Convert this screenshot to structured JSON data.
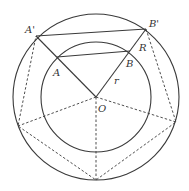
{
  "diagram": {
    "type": "geometry",
    "center": {
      "label": "O",
      "x": 96,
      "y": 97
    },
    "outer_circle": {
      "r": 83,
      "radius_label": "R"
    },
    "inner_circle": {
      "r": 55,
      "radius_label": "r"
    },
    "points": [
      {
        "label": "A'",
        "x": 36,
        "y": 36,
        "label_x": 25,
        "label_y": 33
      },
      {
        "label": "B'",
        "x": 146,
        "y": 29,
        "label_x": 149,
        "label_y": 27
      },
      {
        "label": "A",
        "x": 57,
        "y": 57,
        "label_x": 53,
        "label_y": 76
      },
      {
        "label": "B",
        "x": 130,
        "y": 51,
        "label_x": 126,
        "label_y": 67
      },
      {
        "label": "R",
        "x": 138,
        "y": 40,
        "label_x": 139,
        "label_y": 51
      },
      {
        "label": "r",
        "x": 115,
        "y": 78,
        "label_x": 114,
        "label_y": 84
      },
      {
        "label": "O",
        "x": 96,
        "y": 97,
        "label_x": 98,
        "label_y": 112
      }
    ],
    "pentagon_vertices": [
      {
        "x": 36,
        "y": 36
      },
      {
        "x": 146,
        "y": 29
      },
      {
        "x": 176,
        "y": 122
      },
      {
        "x": 96,
        "y": 180
      },
      {
        "x": 18,
        "y": 126
      }
    ],
    "labels": {
      "A_prime": "A'",
      "B_prime": "B'",
      "A": "A",
      "B": "B",
      "R": "R",
      "r": "r",
      "O": "O"
    }
  }
}
